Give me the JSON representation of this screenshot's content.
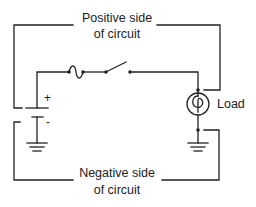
{
  "diagram": {
    "type": "circuit-schematic",
    "labels": {
      "positive_line1": "Positive side",
      "positive_line2": "of circuit",
      "negative_line1": "Negative side",
      "negative_line2": "of circuit",
      "load": "Load",
      "plus": "+",
      "minus": "-"
    },
    "components": [
      "battery",
      "fuse",
      "switch (open)",
      "lamp/load",
      "ground",
      "ground"
    ],
    "colors": {
      "line": "#222222",
      "background": "#ffffff"
    }
  }
}
